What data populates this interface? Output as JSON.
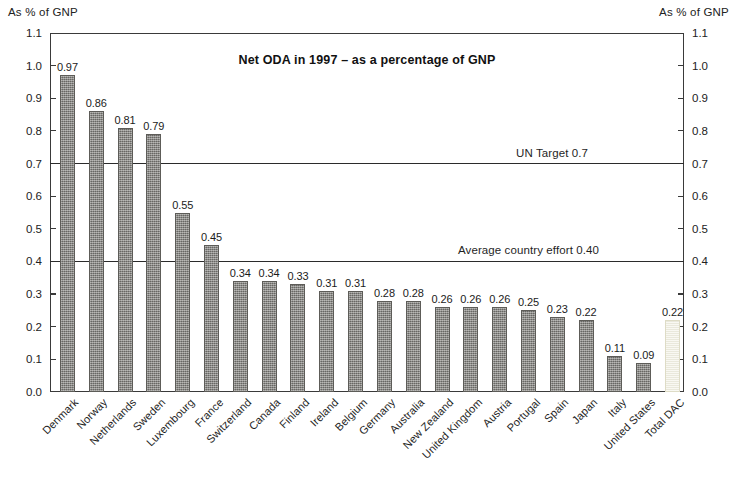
{
  "axis_caption_left": "As % of GNP",
  "axis_caption_right": "As % of GNP",
  "chart_data": {
    "type": "bar",
    "title": "Net ODA in 1997 – as a percentage of GNP",
    "xlabel": "",
    "ylabel": "As % of GNP",
    "ylim": [
      0.0,
      1.1
    ],
    "ytick_step": 0.1,
    "grid": false,
    "legend": "none",
    "categories": [
      "Denmark",
      "Norway",
      "Netherlands",
      "Sweden",
      "Luxembourg",
      "France",
      "Switzerland",
      "Canada",
      "Finland",
      "Ireland",
      "Belgium",
      "Germany",
      "Australia",
      "New Zealand",
      "United Kingdom",
      "Austria",
      "Portugal",
      "Spain",
      "Japan",
      "Italy",
      "United States",
      "Total DAC"
    ],
    "values": [
      0.97,
      0.86,
      0.81,
      0.79,
      0.55,
      0.45,
      0.34,
      0.34,
      0.33,
      0.31,
      0.31,
      0.28,
      0.28,
      0.26,
      0.26,
      0.26,
      0.25,
      0.23,
      0.22,
      0.11,
      0.09,
      0.22
    ],
    "value_labels": [
      "0.97",
      "0.86",
      "0.81",
      "0.79",
      "0.55",
      "0.45",
      "0.34",
      "0.34",
      "0.33",
      "0.31",
      "0.31",
      "0.28",
      "0.28",
      "0.26",
      "0.26",
      "0.26",
      "0.25",
      "0.23",
      "0.22",
      "0.11",
      "0.09",
      "0.22"
    ],
    "highlight_index": 21,
    "ytick_labels": [
      "0.0",
      "0.1",
      "0.2",
      "0.3",
      "0.4",
      "0.5",
      "0.6",
      "0.7",
      "0.8",
      "0.9",
      "1.0",
      "1.1"
    ],
    "ytick_values": [
      0.0,
      0.1,
      0.2,
      0.3,
      0.4,
      0.5,
      0.6,
      0.7,
      0.8,
      0.9,
      1.0,
      1.1
    ],
    "reference_lines": [
      {
        "label": "UN Target 0.7",
        "value": 0.7
      },
      {
        "label": "Average country effort 0.40",
        "value": 0.4
      }
    ],
    "colors": {
      "bar": "#7e7d78",
      "bar_highlight": "#f2f1e4",
      "axis": "#3a3a3a",
      "reference_line": "#2b2b2b",
      "text": "#1a1a1a"
    }
  }
}
